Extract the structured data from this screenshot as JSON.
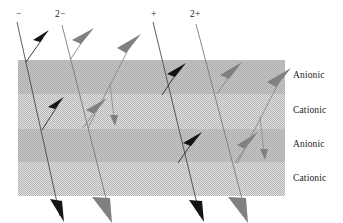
{
  "figure": {
    "canvas": {
      "width": 343,
      "height": 223,
      "background": "#ffffff"
    },
    "membrane_stack": {
      "x": 18,
      "width": 267,
      "top": 60,
      "bottom": 196,
      "layers": [
        {
          "label": "Anionic",
          "y_top": 60,
          "y_bottom": 94,
          "fill": "#bdbdbd",
          "pattern": "solid-gray",
          "label_y": 70
        },
        {
          "label": "Cationic",
          "y_top": 94,
          "y_bottom": 129,
          "fill": "#cecece",
          "pattern": "checker-dither",
          "label_y": 105
        },
        {
          "label": "Anionic",
          "y_top": 129,
          "y_bottom": 162,
          "fill": "#bdbdbd",
          "pattern": "solid-gray",
          "label_y": 139
        },
        {
          "label": "Cationic",
          "y_top": 162,
          "y_bottom": 196,
          "fill": "#cecece",
          "pattern": "checker-dither",
          "label_y": 173
        }
      ]
    },
    "layer_label_x": 293,
    "top_labels": [
      {
        "text": "−",
        "x": 16,
        "y": 9
      },
      {
        "text": "2−",
        "x": 55,
        "y": 9
      },
      {
        "text": "+",
        "x": 151,
        "y": 9
      },
      {
        "text": "2+",
        "x": 190,
        "y": 9
      }
    ],
    "colors": {
      "dark_trace": "#1a1a1a",
      "gray_trace": "#808080",
      "line_stroke": "#4a4a4a",
      "band_dark": "#bdbdbd",
      "band_light": "#cecece",
      "text": "#1c1c1c"
    },
    "traces": [
      {
        "id": "minus-ion",
        "species": "−",
        "color": "#1a1a1a",
        "main_path": "M 17,22 L 60,216",
        "branch_arrows": [
          {
            "path": "M 26,62 L 43,38",
            "size": "large"
          },
          {
            "path": "M 42,130 L 58,105",
            "size": "large"
          }
        ],
        "terminal_arrow": {
          "at": [
            60,
            216
          ],
          "angle": 77,
          "size": "large"
        }
      },
      {
        "id": "double-minus-ion",
        "species": "2−",
        "color": "#808080",
        "main_path": "M 62,25 L 110,214",
        "branch_arrows": [
          {
            "path": "M 70,60 L 88,34",
            "size": "large"
          },
          {
            "path": "M 83,128 L 101,104",
            "size": "large"
          }
        ],
        "terminal_arrow": {
          "at": [
            110,
            214
          ],
          "angle": 76,
          "size": "large"
        }
      },
      {
        "id": "gray-up-left",
        "species": "2−",
        "color": "#808080",
        "main_path": "M 88,128 L 134,40",
        "branch_arrows": [
          {
            "path": "M 111,84 L 116,124",
            "size": "small"
          }
        ],
        "terminal_arrow": {
          "at": [
            134,
            40
          ],
          "angle": -62,
          "size": "large"
        }
      },
      {
        "id": "plus-ion",
        "species": "+",
        "color": "#1a1a1a",
        "main_path": "M 153,22 L 200,216",
        "branch_arrows": [
          {
            "path": "M 162,95 L 180,70",
            "size": "large"
          },
          {
            "path": "M 178,163 L 196,139",
            "size": "large"
          }
        ],
        "terminal_arrow": {
          "at": [
            200,
            216
          ],
          "angle": 77,
          "size": "large"
        }
      },
      {
        "id": "double-plus-ion",
        "species": "2+",
        "color": "#808080",
        "main_path": "M 196,24 L 246,214",
        "branch_arrows": [
          {
            "path": "M 217,94 L 236,70",
            "size": "large"
          },
          {
            "path": "M 235,163 L 252,139",
            "size": "large"
          }
        ],
        "terminal_arrow": {
          "at": [
            246,
            214
          ],
          "angle": 75,
          "size": "large"
        }
      },
      {
        "id": "gray-up-right",
        "species": "2+",
        "color": "#808080",
        "main_path": "M 237,164 L 284,74",
        "branch_arrows": [
          {
            "path": "M 261,117 L 266,156",
            "size": "small"
          }
        ],
        "terminal_arrow": {
          "at": [
            284,
            74
          ],
          "angle": -62,
          "size": "large"
        }
      }
    ]
  }
}
